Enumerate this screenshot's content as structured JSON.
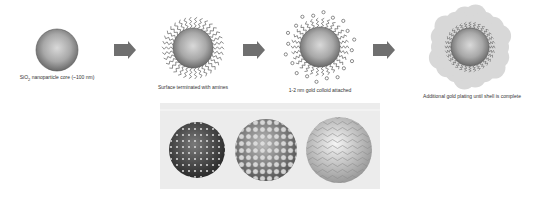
{
  "diagram": {
    "steps": [
      {
        "id": "core",
        "label_pre": "SiO",
        "label_sub": "2",
        "label_post": " nanoparticle core (~100 nm)"
      },
      {
        "id": "amines",
        "label": "Surface terminated with amines"
      },
      {
        "id": "colloid",
        "label": "1-2 nm gold colloid attached"
      },
      {
        "id": "shell",
        "label": "Additional gold plating until shell is complete"
      }
    ],
    "arrows": 3,
    "panel": {
      "description": "Rendered spheres showing progressive gold shell growth",
      "spheres": [
        "sparse gold seeds",
        "denser gold islands",
        "near-complete gold shell"
      ]
    },
    "colors": {
      "core_edge": "#5a5a5a",
      "core_center": "#d0d0d0",
      "arrow": "#6f6f6f",
      "shell_cloud": "#d8d8d8",
      "panel_bg": "#ececec"
    }
  }
}
